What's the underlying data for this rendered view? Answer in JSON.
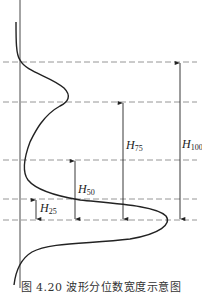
{
  "figure": {
    "caption": "图 4.20  波形分位数宽度示意图",
    "line_color": "#222222",
    "dash_color": "#888888"
  },
  "labels": {
    "h25": {
      "main": "H",
      "sub": "25"
    },
    "h50": {
      "main": "H",
      "sub": "50"
    },
    "h75": {
      "main": "H",
      "sub": "75"
    },
    "h100": {
      "main": "H",
      "sub": "100"
    }
  },
  "dashed_levels": [
    "top (100% level)",
    "75% level",
    "50% level",
    "25% level",
    "peak"
  ]
}
